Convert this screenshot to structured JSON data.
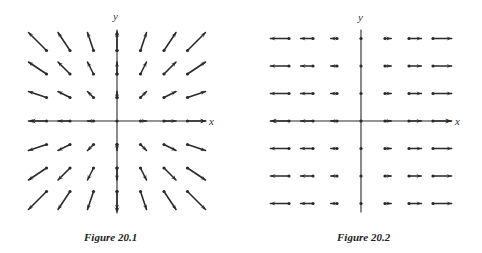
{
  "figures": [
    {
      "id": "fig1",
      "caption": "Figure 20.1",
      "x_label": "x",
      "y_label": "y",
      "field": "F(x, y) = (x, y)",
      "origin": [
        117,
        121
      ],
      "spacing": [
        23.5,
        23.5
      ],
      "scale": 6.0,
      "grid_range": [
        -3,
        3
      ],
      "axis": {
        "x_from": 30,
        "x_to": 206,
        "y_from": 30,
        "y_to": 213,
        "x_arrows": "both",
        "y_arrows": "both"
      },
      "label_pos": {
        "x": [
          209,
          116
        ],
        "y": [
          113,
          11
        ]
      },
      "caption_pos": [
        84,
        231
      ],
      "color": "#2a2a2a"
    },
    {
      "id": "fig2",
      "caption": "Figure 20.2",
      "x_label": "x",
      "y_label": "y",
      "field": "F(x, y) = (x, 0)",
      "origin": [
        120,
        121
      ],
      "spacing": [
        24,
        27.5
      ],
      "scale": 6.2,
      "grid_range": [
        -3,
        3
      ],
      "axis": {
        "x_from": 30,
        "x_to": 210,
        "y_from": 30,
        "y_to": 212,
        "x_arrows": "both",
        "y_arrows": "none"
      },
      "label_pos": {
        "x": [
          214,
          116
        ],
        "y": [
          117,
          12
        ]
      },
      "caption_pos": [
        96,
        231
      ],
      "color": "#2a2a2a"
    }
  ]
}
